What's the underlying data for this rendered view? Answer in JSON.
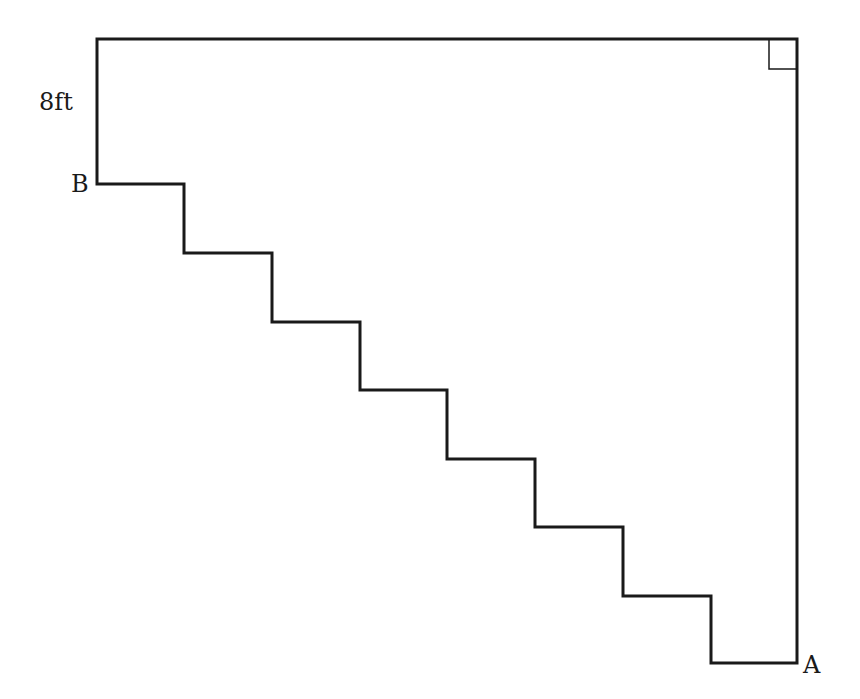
{
  "diagram": {
    "type": "staircase-outline",
    "stroke_color": "#1a1a1a",
    "background": "#ffffff",
    "labels": {
      "height_label": "8ft",
      "point_b": "B",
      "point_a": "A"
    },
    "outline_points": [
      [
        97,
        39
      ],
      [
        797,
        39
      ],
      [
        797,
        663
      ],
      [
        711,
        663
      ],
      [
        711,
        596
      ],
      [
        623,
        596
      ],
      [
        623,
        527
      ],
      [
        535,
        527
      ],
      [
        535,
        459
      ],
      [
        447,
        459
      ],
      [
        447,
        390
      ],
      [
        360,
        390
      ],
      [
        360,
        322
      ],
      [
        272,
        322
      ],
      [
        272,
        253
      ],
      [
        184,
        253
      ],
      [
        184,
        184
      ],
      [
        97,
        184
      ]
    ],
    "steps": 7,
    "right_angle_marker": {
      "corner": "top-right"
    }
  }
}
